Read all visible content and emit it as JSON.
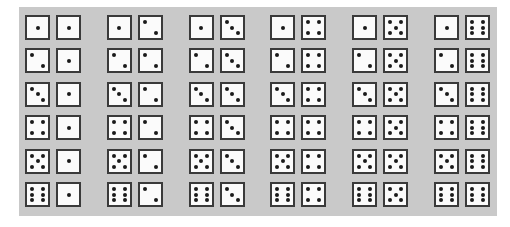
{
  "diagram": {
    "rows": 6,
    "columns": 6,
    "row_variable": "first die value",
    "column_variable": "second die value",
    "colors": {
      "page_background": "#ffffff",
      "panel_background": "#c9c9c9",
      "die_face": "#fbfbfb",
      "die_border": "#3a3a3a",
      "pip": "#1a1a1a"
    },
    "pairs": [
      [
        [
          1,
          1
        ],
        [
          1,
          2
        ],
        [
          1,
          3
        ],
        [
          1,
          4
        ],
        [
          1,
          5
        ],
        [
          1,
          6
        ]
      ],
      [
        [
          2,
          1
        ],
        [
          2,
          2
        ],
        [
          2,
          3
        ],
        [
          2,
          4
        ],
        [
          2,
          5
        ],
        [
          2,
          6
        ]
      ],
      [
        [
          3,
          1
        ],
        [
          3,
          2
        ],
        [
          3,
          3
        ],
        [
          3,
          4
        ],
        [
          3,
          5
        ],
        [
          3,
          6
        ]
      ],
      [
        [
          4,
          1
        ],
        [
          4,
          2
        ],
        [
          4,
          3
        ],
        [
          4,
          4
        ],
        [
          4,
          5
        ],
        [
          4,
          6
        ]
      ],
      [
        [
          5,
          1
        ],
        [
          5,
          2
        ],
        [
          5,
          3
        ],
        [
          5,
          4
        ],
        [
          5,
          5
        ],
        [
          5,
          6
        ]
      ],
      [
        [
          6,
          1
        ],
        [
          6,
          2
        ],
        [
          6,
          3
        ],
        [
          6,
          4
        ],
        [
          6,
          5
        ],
        [
          6,
          6
        ]
      ]
    ]
  }
}
